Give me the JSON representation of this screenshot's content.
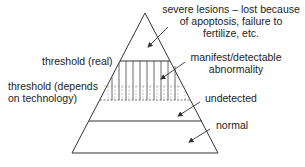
{
  "diagram": {
    "colors": {
      "line": "#333333",
      "text": "#222222",
      "background": "#ffffff"
    },
    "regions": [
      {
        "id": "severe",
        "label_lines": [
          "severe lesions – lost because",
          "of apoptosis, failure to",
          "fertilize, etc."
        ]
      },
      {
        "id": "manifest",
        "label_lines": [
          "manifest/detectable",
          "abnormality"
        ]
      },
      {
        "id": "undetected",
        "label_lines": [
          "undetected"
        ]
      },
      {
        "id": "normal",
        "label_lines": [
          "normal"
        ]
      }
    ],
    "thresholds": [
      {
        "id": "real",
        "label_lines": [
          "threshold (real)"
        ],
        "style": "solid"
      },
      {
        "id": "technology",
        "label_lines": [
          "threshold (depends",
          "on technology)"
        ],
        "style": "dashed"
      }
    ]
  }
}
